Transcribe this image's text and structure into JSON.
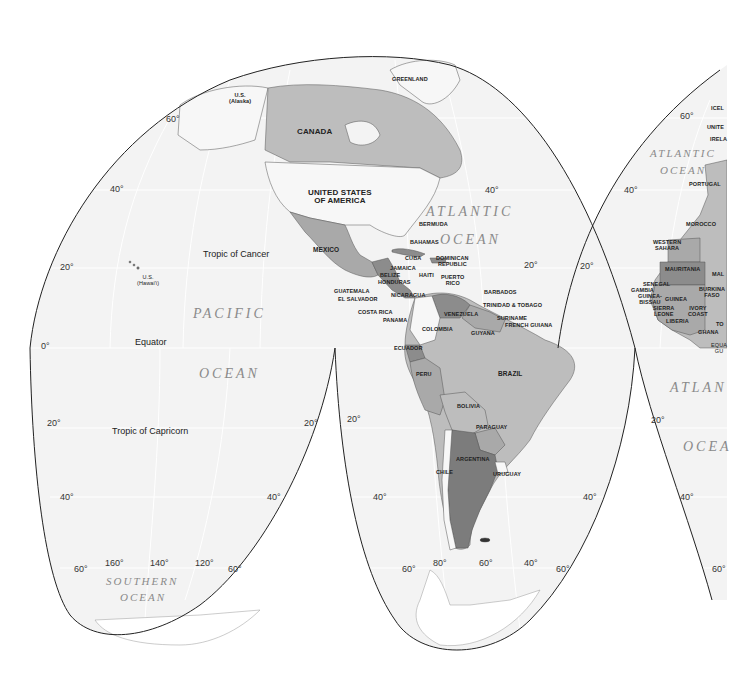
{
  "map": {
    "projection": "interrupted-goode-homolosine",
    "colors": {
      "background": "#ffffff",
      "ocean": "#f3f3f3",
      "graticule": "#ffffff",
      "outline": "#222222",
      "land_light": "#f7f7f7",
      "land_mid": "#bdbdbd",
      "land_gray": "#a9a9a9",
      "land_dark": "#8c8c8c",
      "land_darker": "#7c7c7c"
    },
    "countries": [
      {
        "id": "greenland",
        "name": "GREENLAND"
      },
      {
        "id": "alaska",
        "name": "U.S.",
        "sub": "(Alaska)"
      },
      {
        "id": "canada",
        "name": "CANADA"
      },
      {
        "id": "usa",
        "name": "UNITED STATES",
        "sub": "OF AMERICA"
      },
      {
        "id": "mexico",
        "name": "MEXICO"
      },
      {
        "id": "bermuda",
        "name": "BERMUDA"
      },
      {
        "id": "bahamas",
        "name": "BAHAMAS"
      },
      {
        "id": "cuba",
        "name": "CUBA"
      },
      {
        "id": "dominican",
        "name": "DOMINICAN",
        "sub": "REPUBLIC"
      },
      {
        "id": "jamaica",
        "name": "JAMAICA"
      },
      {
        "id": "haiti",
        "name": "HAITI"
      },
      {
        "id": "puerto_rico",
        "name": "PUERTO",
        "sub": "RICO"
      },
      {
        "id": "belize",
        "name": "BELIZE"
      },
      {
        "id": "honduras",
        "name": "HONDURAS"
      },
      {
        "id": "guatemala",
        "name": "GUATEMALA"
      },
      {
        "id": "el_salvador",
        "name": "EL SALVADOR"
      },
      {
        "id": "nicaragua",
        "name": "NICARAGUA"
      },
      {
        "id": "costa_rica",
        "name": "COSTA RICA"
      },
      {
        "id": "panama",
        "name": "PANAMA"
      },
      {
        "id": "barbados",
        "name": "BARBADOS"
      },
      {
        "id": "trinidad",
        "name": "TRINIDAD & TOBAGO"
      },
      {
        "id": "venezuela",
        "name": "VENEZUELA"
      },
      {
        "id": "suriname",
        "name": "SURINAME"
      },
      {
        "id": "french_guiana",
        "name": "FRENCH GUIANA"
      },
      {
        "id": "guyana",
        "name": "GUYANA"
      },
      {
        "id": "colombia",
        "name": "COLOMBIA"
      },
      {
        "id": "ecuador",
        "name": "ECUADOR"
      },
      {
        "id": "peru",
        "name": "PERU"
      },
      {
        "id": "brazil",
        "name": "BRAZIL"
      },
      {
        "id": "bolivia",
        "name": "BOLIVIA"
      },
      {
        "id": "paraguay",
        "name": "PARAGUAY"
      },
      {
        "id": "argentina",
        "name": "ARGENTINA"
      },
      {
        "id": "chile",
        "name": "CHILE"
      },
      {
        "id": "uruguay",
        "name": "URUGUAY"
      },
      {
        "id": "hawaii",
        "name": "U.S.",
        "sub": "(Hawai'i)"
      },
      {
        "id": "iceland",
        "name": "ICEL"
      },
      {
        "id": "uk",
        "name": "UNITE"
      },
      {
        "id": "ireland",
        "name": "IRELA"
      },
      {
        "id": "portugal",
        "name": "PORTUGAL"
      },
      {
        "id": "morocco",
        "name": "MOROCCO"
      },
      {
        "id": "western_sahara",
        "name": "WESTERN",
        "sub": "SAHARA"
      },
      {
        "id": "mauritania",
        "name": "MAURITANIA"
      },
      {
        "id": "mali",
        "name": "MAL"
      },
      {
        "id": "senegal",
        "name": "SENEGAL"
      },
      {
        "id": "gambia",
        "name": "GAMBIA"
      },
      {
        "id": "guinea_bissau",
        "name": "GUINEA-",
        "sub": "BISSAU"
      },
      {
        "id": "guinea",
        "name": "GUINEA"
      },
      {
        "id": "burkina",
        "name": "BURKINA",
        "sub": "FASO"
      },
      {
        "id": "sierra_leone",
        "name": "SIERRA",
        "sub": "LEONE"
      },
      {
        "id": "ivory_coast",
        "name": "IVORY",
        "sub": "COAST"
      },
      {
        "id": "liberia",
        "name": "LIBERIA"
      },
      {
        "id": "togo",
        "name": "TO"
      },
      {
        "id": "ghana",
        "name": "GHANA"
      },
      {
        "id": "eq_guinea",
        "name": "EQUA",
        "sub": "GU"
      }
    ],
    "oceans": {
      "pacific_1": "PACIFIC",
      "pacific_2": "OCEAN",
      "atlantic_n_1": "ATLANTIC",
      "atlantic_n_2": "OCEAN",
      "atlantic_ne_1": "ATLANTIC",
      "atlantic_ne_2": "OCEAN",
      "atlantic_s_1": "ATLAN",
      "atlantic_s_2": "OCEA",
      "southern_1": "SOUTHERN",
      "southern_2": "OCEAN"
    },
    "lines": {
      "tropic_cancer": "Tropic of Cancer",
      "equator": "Equator",
      "tropic_capricorn": "Tropic of Capricorn"
    },
    "degree_labels": {
      "lat60_nw": "60°",
      "lat40_nw": "40°",
      "lat20_nw": "20°",
      "lat0_w": "0°",
      "lat40_ne_amer": "40°",
      "lat20_ne_amer": "20°",
      "lat60_ne": "60°",
      "lat40_ne": "40°",
      "lat20_ne": "20°",
      "lat20_sw1": "20°",
      "lat20_sw1r": "20°",
      "lat40_sw1": "40°",
      "lat40_sw1r": "40°",
      "lat60_sw1": "60°",
      "lat60_sw1r": "60°",
      "lon160": "160°",
      "lon140": "140°",
      "lon120": "120°",
      "lat20_sw2": "20°",
      "lat40_sw2": "40°",
      "lat40_sw2r": "40°",
      "lat60_sw2": "60°",
      "lat60_sw2r": "60°",
      "lon80": "80°",
      "lon60": "60°",
      "lon40": "40°",
      "lat20_se": "20°",
      "lat40_se": "40°",
      "lat60_se": "60°"
    }
  }
}
